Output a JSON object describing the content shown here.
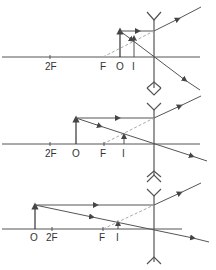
{
  "figure": {
    "colors": {
      "line": "#555555",
      "dashed": "#aaaaaa",
      "text": "#333333",
      "background": "#ffffff"
    },
    "panels": [
      {
        "id": "panel-1",
        "caption": "Object between F and lens",
        "labels": {
          "two_f": "2F",
          "f": "F",
          "object": "O",
          "image": "I"
        }
      },
      {
        "id": "panel-2",
        "caption": "Object between 2F and F",
        "labels": {
          "two_f": "2F",
          "object": "O",
          "f": "F",
          "image": "I"
        }
      },
      {
        "id": "panel-3",
        "caption": "Object beyond 2F",
        "labels": {
          "object": "O",
          "two_f": "2F",
          "f": "F",
          "image": "I"
        }
      }
    ]
  }
}
